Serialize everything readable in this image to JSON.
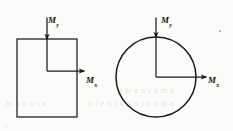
{
  "figure": {
    "background_color": "#fbfbf9",
    "stroke_color": "#1a1a1a",
    "panels": [
      {
        "name": "rectangular-section",
        "shape": "rectangle",
        "shape_bounds": {
          "x": 17,
          "y": 39,
          "width": 60,
          "height": 78
        },
        "axis_origin": {
          "x": 47,
          "y": 71
        },
        "labels": {
          "vertical": {
            "base": "M",
            "subscript": "y"
          },
          "horizontal": {
            "base": "M",
            "subscript": "x"
          }
        },
        "arrows": [
          {
            "name": "my-arrow",
            "direction": "down",
            "from": {
              "x": 47,
              "y": 17
            },
            "to": {
              "x": 47,
              "y": 39
            }
          },
          {
            "name": "mx-arrow",
            "direction": "right",
            "from": {
              "x": 47,
              "y": 71
            },
            "to": {
              "x": 84,
              "y": 71
            }
          }
        ]
      },
      {
        "name": "circular-section",
        "shape": "circle",
        "shape_bounds": {
          "cx": 156,
          "cy": 77,
          "r": 40
        },
        "axis_origin": {
          "x": 156,
          "y": 77
        },
        "labels": {
          "vertical": {
            "base": "M",
            "subscript": "y"
          },
          "horizontal": {
            "base": "M",
            "subscript": "x"
          }
        },
        "arrows": [
          {
            "name": "my-arrow",
            "direction": "down",
            "from": {
              "x": 156,
              "y": 17
            },
            "to": {
              "x": 156,
              "y": 37
            }
          },
          {
            "name": "mx-arrow",
            "direction": "right",
            "from": {
              "x": 156,
              "y": 77
            },
            "to": {
              "x": 206,
              "y": 77
            }
          }
        ]
      }
    ],
    "ghost_text": {
      "row_1": "a m a n i u m n",
      "row_2": "m u n u  t a",
      "row_3": "o t e n  i n  a u  t u  o m  a"
    }
  }
}
